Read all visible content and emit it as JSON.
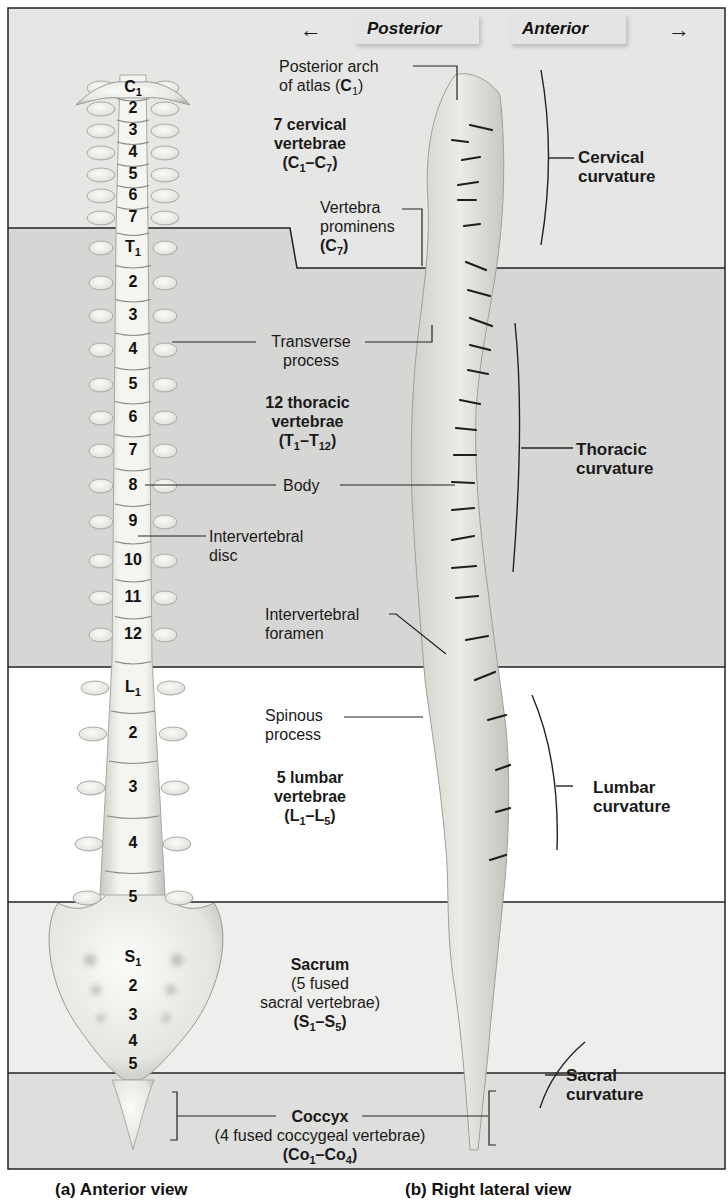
{
  "header": {
    "posterior_label": "Posterior",
    "anterior_label": "Anterior",
    "posterior_arrow": "←",
    "anterior_arrow": "→"
  },
  "colors": {
    "cervical_band": "#e6e6e4",
    "thoracic_band": "#d6d6d4",
    "lumbar_band": "#ffffff",
    "sacral_band": "#eeeeec",
    "coccyx_band": "#dededc",
    "frame_line": "#222222",
    "bone": "#efefea"
  },
  "regions": [
    {
      "id": "cervical",
      "top": 8,
      "bottom": 228
    },
    {
      "id": "thoracic",
      "top": 228,
      "bottom": 667
    },
    {
      "id": "lumbar",
      "top": 667,
      "bottom": 902
    },
    {
      "id": "sacral",
      "top": 902,
      "bottom": 1073
    },
    {
      "id": "coccyx",
      "top": 1073,
      "bottom": 1169
    }
  ],
  "anterior_view": {
    "vertebra_labels": [
      {
        "main": "C",
        "sub": "1",
        "y": 80
      },
      {
        "main": "2",
        "y": 101
      },
      {
        "main": "3",
        "y": 123
      },
      {
        "main": "4",
        "y": 145
      },
      {
        "main": "5",
        "y": 167
      },
      {
        "main": "6",
        "y": 188
      },
      {
        "main": "7",
        "y": 210
      },
      {
        "main": "T",
        "sub": "1",
        "y": 240
      },
      {
        "main": "2",
        "y": 275
      },
      {
        "main": "3",
        "y": 308
      },
      {
        "main": "4",
        "y": 342
      },
      {
        "main": "5",
        "y": 377
      },
      {
        "main": "6",
        "y": 410
      },
      {
        "main": "7",
        "y": 443
      },
      {
        "main": "8",
        "y": 478
      },
      {
        "main": "9",
        "y": 514
      },
      {
        "main": "10",
        "y": 553
      },
      {
        "main": "11",
        "y": 590
      },
      {
        "main": "12",
        "y": 627
      },
      {
        "main": "L",
        "sub": "1",
        "y": 680
      },
      {
        "main": "2",
        "y": 726
      },
      {
        "main": "3",
        "y": 780
      },
      {
        "main": "4",
        "y": 836
      },
      {
        "main": "5",
        "y": 890
      },
      {
        "main": "S",
        "sub": "1",
        "y": 950
      },
      {
        "main": "2",
        "y": 979
      },
      {
        "main": "3",
        "y": 1008
      },
      {
        "main": "4",
        "y": 1034
      },
      {
        "main": "5",
        "y": 1057
      }
    ]
  },
  "labels": {
    "posterior_arch": {
      "line1": "Posterior arch",
      "line2_pre": "of atlas (",
      "line2_bold": "C",
      "line2_sub": "1",
      "line2_post": ")"
    },
    "cervical_count": {
      "line1": "7 cervical",
      "line2": "vertebrae",
      "range_a": "C",
      "range_a_sub": "1",
      "range_b": "C",
      "range_b_sub": "7"
    },
    "vertebra_prominens": {
      "line1": "Vertebra",
      "line2": "prominens",
      "code": "C",
      "code_sub": "7"
    },
    "cervical_curvature": {
      "line1": "Cervical",
      "line2": "curvature"
    },
    "transverse_process": {
      "line1": "Transverse",
      "line2": "process"
    },
    "thoracic_count": {
      "line1": "12 thoracic",
      "line2": "vertebrae",
      "range_a": "T",
      "range_a_sub": "1",
      "range_b": "T",
      "range_b_sub": "12"
    },
    "thoracic_curvature": {
      "line1": "Thoracic",
      "line2": "curvature"
    },
    "body": {
      "line1": "Body"
    },
    "intervertebral_disc": {
      "line1": "Intervertebral",
      "line2": "disc"
    },
    "intervertebral_foramen": {
      "line1": "Intervertebral",
      "line2": "foramen"
    },
    "spinous_process": {
      "line1": "Spinous",
      "line2": "process"
    },
    "lumbar_count": {
      "line1": "5 lumbar",
      "line2": "vertebrae",
      "range_a": "L",
      "range_a_sub": "1",
      "range_b": "L",
      "range_b_sub": "5"
    },
    "lumbar_curvature": {
      "line1": "Lumbar",
      "line2": "curvature"
    },
    "sacrum": {
      "line1": "Sacrum",
      "line2": "(5 fused",
      "line3": "sacral vertebrae)",
      "range_a": "S",
      "range_a_sub": "1",
      "range_b": "S",
      "range_b_sub": "5"
    },
    "sacral_curvature": {
      "line1": "Sacral",
      "line2": "curvature"
    },
    "coccyx": {
      "line1": "Coccyx",
      "line2": "(4 fused coccygeal vertebrae)",
      "range_a": "Co",
      "range_a_sub": "1",
      "range_b": "Co",
      "range_b_sub": "4"
    }
  },
  "captions": {
    "a": "(a) Anterior view",
    "b": "(b) Right lateral view"
  }
}
